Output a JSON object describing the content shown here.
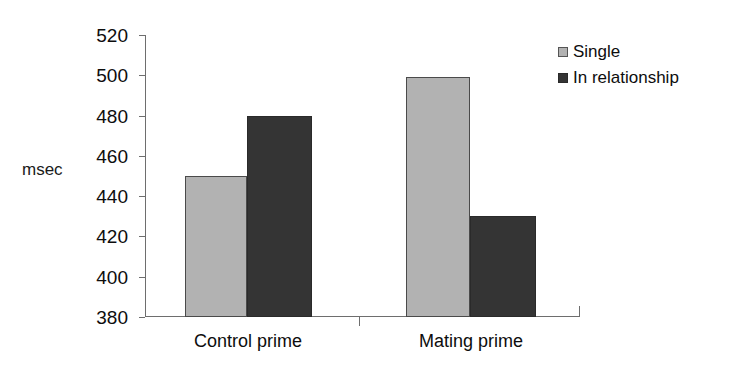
{
  "chart_data": {
    "type": "bar",
    "title": "",
    "subtitle": "",
    "xlabel": "",
    "ylabel": "msec",
    "categories": [
      "Control prime",
      "Mating prime"
    ],
    "series": [
      {
        "name": "Single",
        "color": "#b2b2b2",
        "values": [
          450,
          499
        ]
      },
      {
        "name": "In relationship",
        "color": "#343434",
        "values": [
          480,
          430
        ]
      }
    ],
    "ylim": [
      380,
      520
    ],
    "ytick_step": 20,
    "ytick_labels": [
      "520",
      "500",
      "480",
      "460",
      "440",
      "420",
      "400",
      "380"
    ],
    "ytick_values": [
      520,
      500,
      480,
      460,
      440,
      420,
      400,
      380
    ],
    "grid": false,
    "legend_position": "top-right",
    "annotations": []
  },
  "axis": {
    "y_title": "msec"
  },
  "legend": {
    "items": [
      {
        "label": "Single",
        "swatch": "light-gray-swatch-icon"
      },
      {
        "label": "In relationship",
        "swatch": "dark-gray-swatch-icon"
      }
    ]
  },
  "colors": {
    "single": "#b2b2b2",
    "in_relationship": "#343434",
    "axis": "#6e6e6e",
    "text": "#0d0d0d",
    "background": "#ffffff"
  }
}
